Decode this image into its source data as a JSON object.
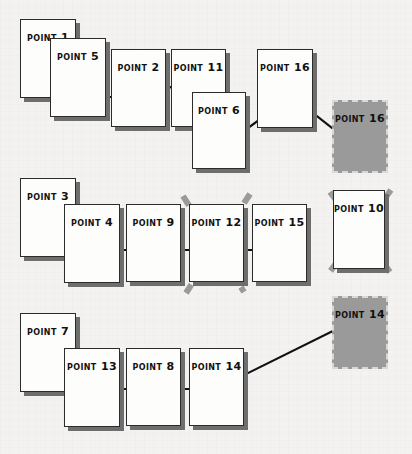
{
  "diagram": {
    "background_color": "#f3f2f0",
    "card_fill": "#fdfdfc",
    "card_border": "#2b2b2b",
    "card_shadow": "#6e6e6e",
    "ghost_fill": "#9a9a9a",
    "ghost_border": "#d8d8d8",
    "arrow_color": "#111111",
    "strike_color": "#9a9a9a"
  },
  "rows": [
    {
      "name": "row-top",
      "cards": [
        {
          "label": "POINT",
          "num": "1",
          "x": 20,
          "y": 19,
          "w": 56,
          "h": 79,
          "kind": "card"
        },
        {
          "label": "POINT",
          "num": "5",
          "x": 50,
          "y": 38,
          "w": 56,
          "h": 79,
          "kind": "card"
        },
        {
          "label": "POINT",
          "num": "2",
          "x": 111,
          "y": 49,
          "w": 55,
          "h": 78,
          "kind": "card"
        },
        {
          "label": "POINT",
          "num": "11",
          "x": 171,
          "y": 49,
          "w": 55,
          "h": 78,
          "kind": "card"
        },
        {
          "label": "POINT",
          "num": "6",
          "x": 192,
          "y": 92,
          "w": 54,
          "h": 77,
          "kind": "card"
        },
        {
          "label": "POINT",
          "num": "16",
          "x": 257,
          "y": 49,
          "w": 56,
          "h": 79,
          "kind": "card"
        },
        {
          "label": "POINT",
          "num": "16",
          "x": 332,
          "y": 100,
          "w": 56,
          "h": 73,
          "kind": "ghost"
        }
      ]
    },
    {
      "name": "row-middle",
      "cards": [
        {
          "label": "POINT",
          "num": "3",
          "x": 20,
          "y": 178,
          "w": 56,
          "h": 79,
          "kind": "card"
        },
        {
          "label": "POINT",
          "num": "4",
          "x": 64,
          "y": 204,
          "w": 56,
          "h": 79,
          "kind": "card"
        },
        {
          "label": "POINT",
          "num": "9",
          "x": 126,
          "y": 204,
          "w": 55,
          "h": 78,
          "kind": "card"
        },
        {
          "label": "POINT",
          "num": "12",
          "x": 189,
          "y": 204,
          "w": 55,
          "h": 78,
          "kind": "card",
          "struck": true
        },
        {
          "label": "POINT",
          "num": "15",
          "x": 252,
          "y": 204,
          "w": 55,
          "h": 78,
          "kind": "card"
        },
        {
          "label": "POINT",
          "num": "10",
          "x": 333,
          "y": 190,
          "w": 52,
          "h": 79,
          "kind": "card",
          "struck": true
        }
      ]
    },
    {
      "name": "row-bottom",
      "cards": [
        {
          "label": "POINT",
          "num": "14",
          "x": 332,
          "y": 296,
          "w": 56,
          "h": 73,
          "kind": "ghost"
        },
        {
          "label": "POINT",
          "num": "7",
          "x": 20,
          "y": 313,
          "w": 56,
          "h": 79,
          "kind": "card"
        },
        {
          "label": "POINT",
          "num": "13",
          "x": 64,
          "y": 348,
          "w": 56,
          "h": 79,
          "kind": "card"
        },
        {
          "label": "POINT",
          "num": "8",
          "x": 126,
          "y": 348,
          "w": 55,
          "h": 78,
          "kind": "card"
        },
        {
          "label": "POINT",
          "num": "14",
          "x": 189,
          "y": 348,
          "w": 55,
          "h": 78,
          "kind": "card"
        }
      ]
    }
  ],
  "connections": [
    {
      "name": "arrow-point1-to-point5",
      "from": [
        31,
        62
      ],
      "to": [
        80,
        93
      ]
    },
    {
      "name": "arrow-point5-to-point2",
      "from": [
        86,
        97
      ],
      "to": [
        136,
        97
      ]
    },
    {
      "name": "arrow-point2-to-point11",
      "from": [
        141,
        100
      ],
      "to": [
        196,
        76
      ]
    },
    {
      "name": "arrow-point11-to-point6",
      "from": [
        178,
        104
      ],
      "to": [
        226,
        139
      ]
    },
    {
      "name": "arrow-point6-to-point16",
      "from": [
        233,
        139
      ],
      "to": [
        281,
        104
      ]
    },
    {
      "name": "arrow-ghost16-to-point16",
      "from": [
        360,
        150
      ],
      "to": [
        294,
        98
      ]
    },
    {
      "name": "arrow-point3-to-point4",
      "from": [
        51,
        211
      ],
      "to": [
        85,
        248
      ]
    },
    {
      "name": "arrow-point4-to-point9",
      "from": [
        93,
        250
      ],
      "to": [
        152,
        250
      ]
    },
    {
      "name": "arrow-point9-to-point15",
      "from": [
        163,
        250
      ],
      "to": [
        272,
        250
      ]
    },
    {
      "name": "arrow-point7-to-point13",
      "from": [
        51,
        346
      ],
      "to": [
        88,
        388
      ]
    },
    {
      "name": "arrow-point13-to-point8",
      "from": [
        105,
        389
      ],
      "to": [
        152,
        389
      ]
    },
    {
      "name": "arrow-point8-to-point14",
      "from": [
        168,
        389
      ],
      "to": [
        215,
        389
      ]
    },
    {
      "name": "arrow-ghost14-to-point14",
      "from": [
        351,
        322
      ],
      "to": [
        236,
        379
      ]
    }
  ],
  "strikethroughs": [
    {
      "name": "strike-point12",
      "x1": 183,
      "y1": 196,
      "x2": 244,
      "y2": 292,
      "x3": 250,
      "y3": 194,
      "x4": 186,
      "y4": 293
    },
    {
      "name": "strike-point10",
      "x1": 330,
      "y1": 192,
      "x2": 390,
      "y2": 272,
      "x3": 391,
      "y3": 190,
      "x4": 329,
      "y4": 273
    }
  ]
}
